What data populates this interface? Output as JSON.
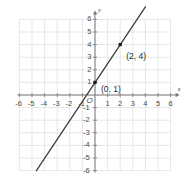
{
  "chart_data": {
    "type": "line",
    "title": "",
    "subtitle": "",
    "xlabel": "x",
    "ylabel": "y",
    "xlim": [
      -6,
      6
    ],
    "ylim": [
      -6,
      6
    ],
    "grid": true,
    "legend": null,
    "origin_label": "O",
    "x_ticks": [
      "-6",
      "-5",
      "-4",
      "-3",
      "-2",
      "-1",
      "1",
      "2",
      "3",
      "4",
      "5",
      "6"
    ],
    "x_tick_values": [
      -6,
      -5,
      -4,
      -3,
      -2,
      -1,
      1,
      2,
      3,
      4,
      5,
      6
    ],
    "y_ticks": [
      "6",
      "5",
      "4",
      "3",
      "2",
      "1",
      "-1",
      "-2",
      "-3",
      "-4",
      "-5",
      "-6"
    ],
    "y_tick_values": [
      6,
      5,
      4,
      3,
      2,
      1,
      -1,
      -2,
      -3,
      -4,
      -5,
      -6
    ],
    "series": [
      {
        "name": "line",
        "equation": "y = 1.5x + 1",
        "slope": 1.5,
        "intercept": 1,
        "endpoints": [
          [
            -4.65,
            -6.0
          ],
          [
            4.0,
            7.0
          ]
        ],
        "color": "#3d3d3d"
      }
    ],
    "points": [
      {
        "label": "(0, 1)",
        "x": 0,
        "y": 1,
        "label_dx": 6,
        "label_dy": 3
      },
      {
        "label": "(2, 4)",
        "x": 2,
        "y": 4,
        "label_dx": 6,
        "label_dy": 7
      }
    ],
    "colors": {
      "grid": "#dcdcdc",
      "axis": "#7a7a7a",
      "line": "#3d3d3d",
      "point": "#1a1a1a",
      "text": "#4a4a4a",
      "background": "#ffffff"
    }
  }
}
